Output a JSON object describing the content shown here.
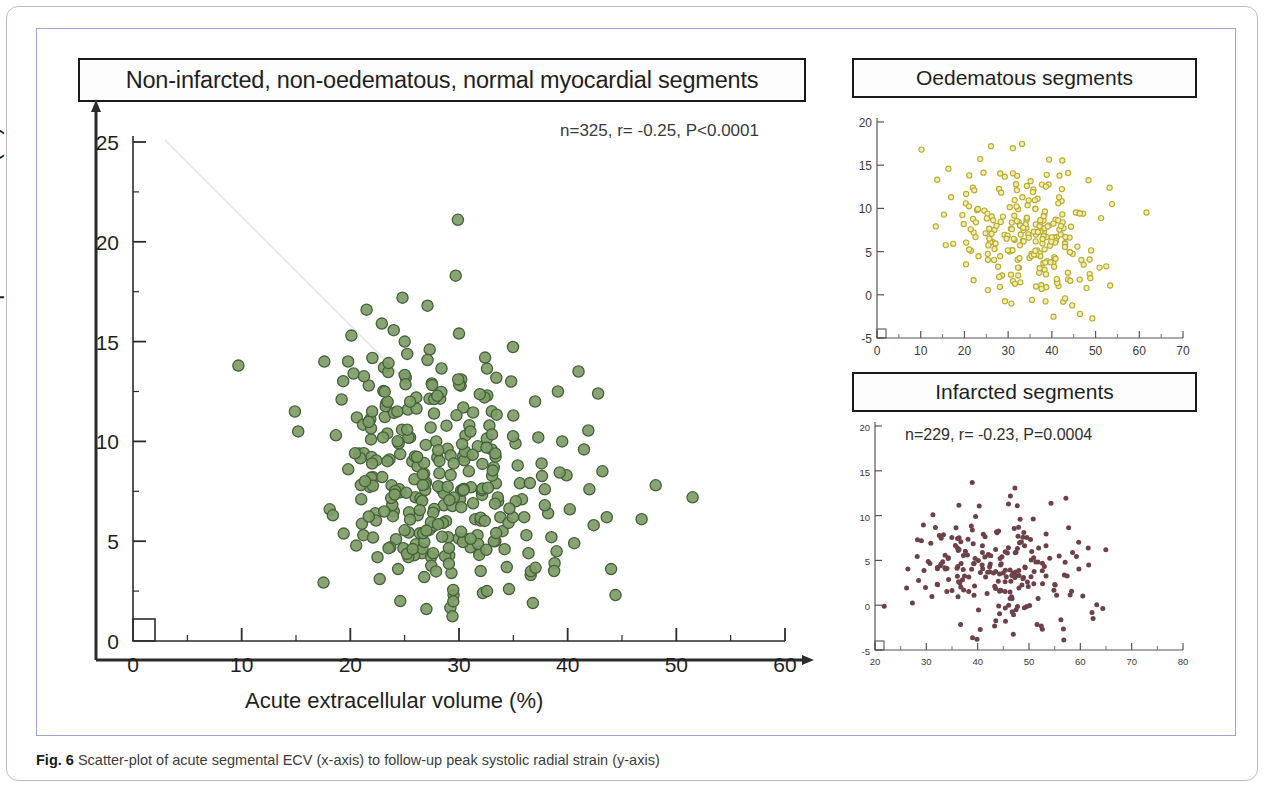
{
  "figure": {
    "caption_number": "Fig. 6",
    "caption_text": "Scatter-plot of acute segmental ECV (x-axis) to follow-up peak systolic radial strain (y-axis)"
  },
  "main": {
    "title": "Non-infarcted, non-oedematous, normal myocardial segments",
    "stats": "n=325, r= -0.25, P<0.0001",
    "xlabel": "Acute extracellular volume   (%)",
    "ylabel": "Follow-up radial strain (%)"
  },
  "oedematous": {
    "title": "Oedematous segments",
    "stats": "n=246, r= -0.27, P<0.0001"
  },
  "infarcted": {
    "title": "Infarcted segments",
    "stats": "n=229, r= -0.23, P=0.0004"
  },
  "colors": {
    "main_point_fill": "#7d9c66",
    "main_point_stroke": "#44603a",
    "oedematous_point_fill": "#f2ecb0",
    "oedematous_point_stroke": "#b8ac2e",
    "infarcted_point_fill": "#6e4148",
    "axis": "#2b2b2b",
    "frame_blue": "#9aa4cf",
    "frame_gray": "#b9bcc4"
  },
  "chart_data": [
    {
      "id": "main",
      "type": "scatter",
      "title": "Non-infarcted, non-oedematous, normal myocardial segments",
      "annotation": "n=325, r= -0.25, P<0.0001",
      "n": 325,
      "r": -0.25,
      "p": "<0.0001",
      "xlabel": "Acute extracellular volume   (%)",
      "ylabel": "Follow-up radial strain (%)",
      "xlim": [
        0,
        60
      ],
      "ylim": [
        0,
        25
      ],
      "xticks": [
        0,
        10,
        20,
        30,
        40,
        50,
        60
      ],
      "yticks": [
        0,
        5,
        10,
        15,
        20,
        25
      ],
      "xminor_step": 5,
      "yminor_step": 2.5,
      "grid": false,
      "legend": "none",
      "marker": "filled-circle",
      "points": [
        [
          9.7,
          13.8
        ],
        [
          14.9,
          11.5
        ],
        [
          15.2,
          10.5
        ],
        [
          17.6,
          14.0
        ],
        [
          18.1,
          6.6
        ],
        [
          18.4,
          6.3
        ],
        [
          19.2,
          12.1
        ],
        [
          19.8,
          8.6
        ],
        [
          20.1,
          15.3
        ],
        [
          20.3,
          13.4
        ],
        [
          20.6,
          11.2
        ],
        [
          20.8,
          9.4
        ],
        [
          21.0,
          7.1
        ],
        [
          21.2,
          5.3
        ],
        [
          21.5,
          16.6
        ],
        [
          21.7,
          12.8
        ],
        [
          21.9,
          10.1
        ],
        [
          22.1,
          8.2
        ],
        [
          22.3,
          6.4
        ],
        [
          22.5,
          4.2
        ],
        [
          22.7,
          3.1
        ],
        [
          22.9,
          15.9
        ],
        [
          23.1,
          13.7
        ],
        [
          23.3,
          11.9
        ],
        [
          23.4,
          10.4
        ],
        [
          23.6,
          9.1
        ],
        [
          23.8,
          7.8
        ],
        [
          24.0,
          6.5
        ],
        [
          24.2,
          5.1
        ],
        [
          24.4,
          3.6
        ],
        [
          24.6,
          2.0
        ],
        [
          24.8,
          17.2
        ],
        [
          25.0,
          15.0
        ],
        [
          25.1,
          13.2
        ],
        [
          25.3,
          11.6
        ],
        [
          25.5,
          10.2
        ],
        [
          25.7,
          9.0
        ],
        [
          25.9,
          8.1
        ],
        [
          26.0,
          7.2
        ],
        [
          26.2,
          6.3
        ],
        [
          26.4,
          5.4
        ],
        [
          26.6,
          4.4
        ],
        [
          26.8,
          3.2
        ],
        [
          27.0,
          1.6
        ],
        [
          27.1,
          16.8
        ],
        [
          27.3,
          14.6
        ],
        [
          27.5,
          12.9
        ],
        [
          27.7,
          11.4
        ],
        [
          27.9,
          10.0
        ],
        [
          28.0,
          9.2
        ],
        [
          28.2,
          8.4
        ],
        [
          28.4,
          7.6
        ],
        [
          28.6,
          6.8
        ],
        [
          28.8,
          6.0
        ],
        [
          29.0,
          5.2
        ],
        [
          29.1,
          4.3
        ],
        [
          29.3,
          3.4
        ],
        [
          29.5,
          2.3
        ],
        [
          29.7,
          18.3
        ],
        [
          29.9,
          21.1
        ],
        [
          30.0,
          15.4
        ],
        [
          30.2,
          13.1
        ],
        [
          30.4,
          11.7
        ],
        [
          30.6,
          10.3
        ],
        [
          30.8,
          9.3
        ],
        [
          30.9,
          8.5
        ],
        [
          31.1,
          7.7
        ],
        [
          31.3,
          6.9
        ],
        [
          31.5,
          6.1
        ],
        [
          31.7,
          5.3
        ],
        [
          31.9,
          4.5
        ],
        [
          32.0,
          3.5
        ],
        [
          32.2,
          2.4
        ],
        [
          32.4,
          14.2
        ],
        [
          32.6,
          12.3
        ],
        [
          32.8,
          10.8
        ],
        [
          33.0,
          9.6
        ],
        [
          33.2,
          8.7
        ],
        [
          33.4,
          7.9
        ],
        [
          33.6,
          7.0
        ],
        [
          33.8,
          6.2
        ],
        [
          34.0,
          5.5
        ],
        [
          34.2,
          4.6
        ],
        [
          34.4,
          3.7
        ],
        [
          34.6,
          2.6
        ],
        [
          34.8,
          13.0
        ],
        [
          35.0,
          11.3
        ],
        [
          35.2,
          9.9
        ],
        [
          35.4,
          8.8
        ],
        [
          35.6,
          7.9
        ],
        [
          35.8,
          7.1
        ],
        [
          36.0,
          6.2
        ],
        [
          36.2,
          5.3
        ],
        [
          36.4,
          4.4
        ],
        [
          36.6,
          3.3
        ],
        [
          36.8,
          1.9
        ],
        [
          37.0,
          12.0
        ],
        [
          37.3,
          10.2
        ],
        [
          37.6,
          8.9
        ],
        [
          37.9,
          7.6
        ],
        [
          38.2,
          6.4
        ],
        [
          38.5,
          5.2
        ],
        [
          38.8,
          3.9
        ],
        [
          39.1,
          12.5
        ],
        [
          39.5,
          10.0
        ],
        [
          39.9,
          8.3
        ],
        [
          40.2,
          6.6
        ],
        [
          40.6,
          4.9
        ],
        [
          41.0,
          13.5
        ],
        [
          41.5,
          9.6
        ],
        [
          42.0,
          7.6
        ],
        [
          42.4,
          5.8
        ],
        [
          42.8,
          12.4
        ],
        [
          43.2,
          8.5
        ],
        [
          43.6,
          6.2
        ],
        [
          44.0,
          3.6
        ],
        [
          44.4,
          2.3
        ],
        [
          46.8,
          6.1
        ],
        [
          48.1,
          7.8
        ],
        [
          51.5,
          7.2
        ]
      ],
      "notes": "325 points total; dense cluster centred near x=27%, y=8%; listed coordinates are representative of the plotted cloud"
    },
    {
      "id": "oedematous",
      "type": "scatter",
      "title": "Oedematous segments",
      "annotation": "n=246, r= -0.27, P<0.0001",
      "n": 246,
      "r": -0.27,
      "p": "<0.0001",
      "xlim": [
        0,
        70
      ],
      "ylim": [
        -5,
        20
      ],
      "xticks": [
        0,
        10,
        20,
        30,
        40,
        50,
        60,
        70
      ],
      "yticks": [
        -5,
        0,
        5,
        10,
        15,
        20
      ],
      "grid": false,
      "marker": "open-circle",
      "center": [
        35,
        7
      ],
      "notes": "246 open yellow circles, cloud centred near x=35%, y=7%, spreading x 3-63, y -3 to 19.5"
    },
    {
      "id": "infarcted",
      "type": "scatter",
      "title": "Infarcted segments",
      "annotation": "n=229, r= -0.23, P=0.0004",
      "n": 229,
      "r": -0.23,
      "p": "=0.0004",
      "xlim": [
        20,
        80
      ],
      "ylim": [
        -5,
        20
      ],
      "xticks": [
        20,
        30,
        40,
        50,
        60,
        70,
        80
      ],
      "yticks": [
        -5,
        0,
        5,
        10,
        15,
        20
      ],
      "grid": false,
      "marker": "filled-dot",
      "center": [
        44,
        4.5
      ],
      "notes": "229 small dark maroon dots, cloud centred near x=44%, y=4.5%, spreading x 22-76, y -4.5 to 15.5"
    }
  ]
}
